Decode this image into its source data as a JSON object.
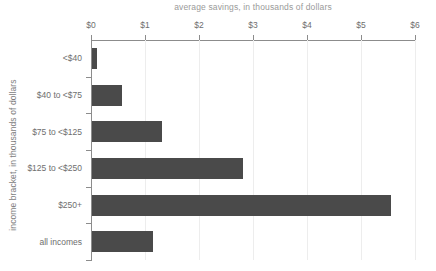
{
  "chart_data": {
    "type": "bar",
    "orientation": "horizontal",
    "title": "average savings, in thousands of dollars",
    "xlabel": "average savings, in thousands of dollars",
    "ylabel": "income bracket, in thousands of dollars",
    "categories": [
      "<$40",
      "$40 to <$75",
      "$75 to <$125",
      "$125 to <$250",
      "$250+",
      "all incomes"
    ],
    "values": [
      0.09,
      0.55,
      1.3,
      2.8,
      5.54,
      1.13
    ],
    "xlim": [
      0,
      6
    ],
    "xticks": [
      0,
      1,
      2,
      3,
      4,
      5,
      6
    ],
    "xtick_labels": [
      "$0",
      "$1",
      "$2",
      "$3",
      "$4",
      "$5",
      "$6"
    ],
    "grid": true,
    "legend": false,
    "bar_color": "#4a4a4a",
    "gridline_color": "#ededed",
    "axis_color": "#8c8c8c",
    "tick_label_color": "#6e6e6e",
    "title_color": "#9a9a9a"
  }
}
